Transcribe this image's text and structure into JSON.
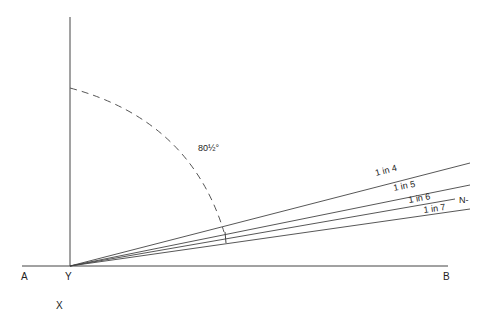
{
  "diagram": {
    "points": {
      "A": "A",
      "Y": "Y",
      "B": "B",
      "X": "X",
      "N": "N-"
    },
    "angle_label": "80½°",
    "gradient_lines": [
      {
        "label": "1 in 4",
        "end": [
          470,
          163
        ]
      },
      {
        "label": "1 in 5",
        "end": [
          470,
          185
        ]
      },
      {
        "label": "1 in 6",
        "end": [
          455,
          199
        ]
      },
      {
        "label": "1 in 7",
        "end": [
          470,
          209
        ]
      }
    ],
    "colors": {
      "line": "#444444",
      "text": "#222222",
      "background": "#ffffff"
    }
  }
}
